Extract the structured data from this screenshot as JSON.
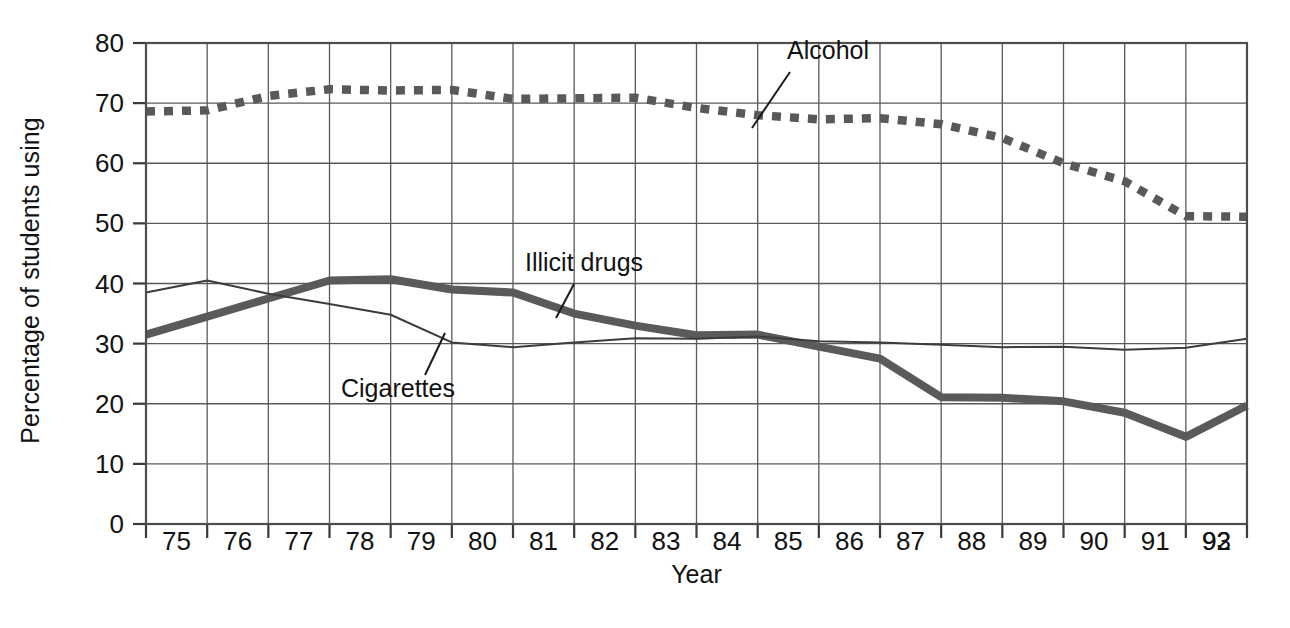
{
  "chart_data": {
    "type": "line",
    "title": "",
    "xlabel": "Year",
    "ylabel": "Percentage of students using",
    "xlim": [
      75,
      93
    ],
    "ylim": [
      0,
      80
    ],
    "yticks": [
      0,
      10,
      20,
      30,
      40,
      50,
      60,
      70,
      80
    ],
    "grid": true,
    "legend_position": "inline-annotations",
    "categories": [
      "75",
      "76",
      "77",
      "78",
      "79",
      "80",
      "81",
      "82",
      "83",
      "84",
      "85",
      "86",
      "87",
      "88",
      "89",
      "90",
      "91",
      "92",
      "93"
    ],
    "x": [
      75,
      76,
      77,
      78,
      79,
      80,
      81,
      82,
      83,
      84,
      85,
      86,
      87,
      88,
      89,
      90,
      91,
      92,
      93
    ],
    "series": [
      {
        "name": "Alcohol",
        "style": "dotted-thick",
        "color": "#595959",
        "values": [
          68.6,
          68.8,
          71.2,
          72.3,
          72.1,
          72.2,
          70.7,
          70.8,
          70.9,
          69.2,
          68.0,
          67.3,
          67.5,
          66.5,
          64.2,
          60.0,
          57.0,
          51.2,
          51.1
        ]
      },
      {
        "name": "Illicit drugs",
        "style": "solid-thick",
        "color": "#5a5a5a",
        "values": [
          31.5,
          34.5,
          37.5,
          40.5,
          40.7,
          39.0,
          38.5,
          35.0,
          33.0,
          31.4,
          31.5,
          29.5,
          27.5,
          21.1,
          21.0,
          20.4,
          18.5,
          14.5,
          19.7
        ]
      },
      {
        "name": "Cigarettes",
        "style": "solid-thin",
        "color": "#3c3c3c",
        "values": [
          38.5,
          40.5,
          38.3,
          36.6,
          34.8,
          30.2,
          29.4,
          30.2,
          30.9,
          30.8,
          31.2,
          30.4,
          30.2,
          29.8,
          29.4,
          29.5,
          29.0,
          29.3,
          30.8
        ]
      }
    ],
    "annotations": [
      {
        "text": "Alcohol",
        "label_x": 787,
        "label_y": 36,
        "line_x1": 790,
        "line_y1": 72,
        "line_x2": 752,
        "line_y2": 128
      },
      {
        "text": "Illicit drugs",
        "label_x": 525,
        "label_y": 248,
        "line_x1": 574,
        "line_y1": 284,
        "line_x2": 556,
        "line_y2": 318
      },
      {
        "text": "Cigarettes",
        "label_x": 341,
        "label_y": 374,
        "line_x1": 425,
        "line_y1": 375,
        "line_x2": 445,
        "line_y2": 333
      }
    ]
  },
  "axis": {
    "y_title": "Percentage of students using",
    "x_title": "Year"
  }
}
